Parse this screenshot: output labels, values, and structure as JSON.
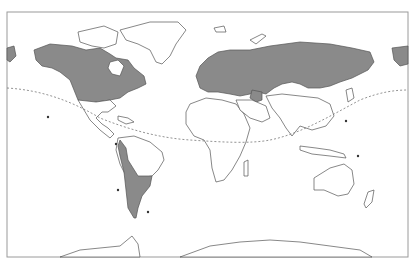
{
  "map": {
    "type": "world-outline-map",
    "colors": {
      "shaded_region": "#8a8a8a",
      "land": "#ffffff",
      "outline": "#555555",
      "dashed_line": "#777777",
      "background": "#ffffff"
    },
    "shaded_regions": [
      "North America (Canada and United States)",
      "Northern Europe and Russia",
      "Southern South America",
      "Alaska / Far East Siberia"
    ],
    "legend": null,
    "labels": []
  }
}
